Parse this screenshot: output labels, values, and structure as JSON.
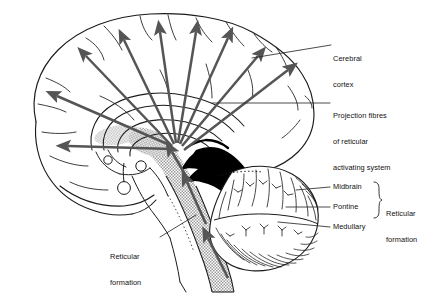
{
  "figure": {
    "background_color": "#ffffff",
    "width": 428,
    "height": 300
  },
  "colors": {
    "outline": "#1a1a1a",
    "arrow": "#555555",
    "stipple_gray": "#b9b9b9",
    "solid_black": "#000000",
    "leader_line": "#2b2b2b",
    "label_text": "#111111"
  },
  "labels": {
    "cerebral_cortex": {
      "lines": [
        "Cerebral",
        "cortex"
      ],
      "line1": "Cerebral",
      "line2": "cortex"
    },
    "projection_fibres": {
      "lines": [
        "Projection fibres",
        "of reticular",
        "activating system"
      ],
      "line1": "Projection fibres",
      "line2": "of reticular",
      "line3": "activating system"
    },
    "reticular_formation_left": {
      "lines": [
        "Reticular",
        "formation"
      ],
      "line1": "Reticular",
      "line2": "formation"
    },
    "reticular_formation_right": {
      "lines": [
        "Reticular",
        "formation"
      ],
      "line1": "Reticular",
      "line2": "formation"
    },
    "midbrain": "Midbrain",
    "pontine": "Pontine",
    "medullary": "Medullary"
  },
  "structures": [
    {
      "name": "cerebral-hemisphere",
      "style": "outline"
    },
    {
      "name": "corpus-callosum",
      "style": "outline"
    },
    {
      "name": "thalamus",
      "style": "stipple"
    },
    {
      "name": "brainstem-reticular-formation",
      "style": "stipple"
    },
    {
      "name": "tentorium-cerebelli",
      "style": "solid-black"
    },
    {
      "name": "cerebellum",
      "style": "folia-hatched"
    },
    {
      "name": "spinal-cord",
      "style": "stipple"
    },
    {
      "name": "pituitary",
      "style": "outline"
    }
  ],
  "arrows": {
    "count_cortical": 8,
    "count_brainstem": 3,
    "description": "Projection fibres radiating from reticular formation to cerebral cortex"
  }
}
